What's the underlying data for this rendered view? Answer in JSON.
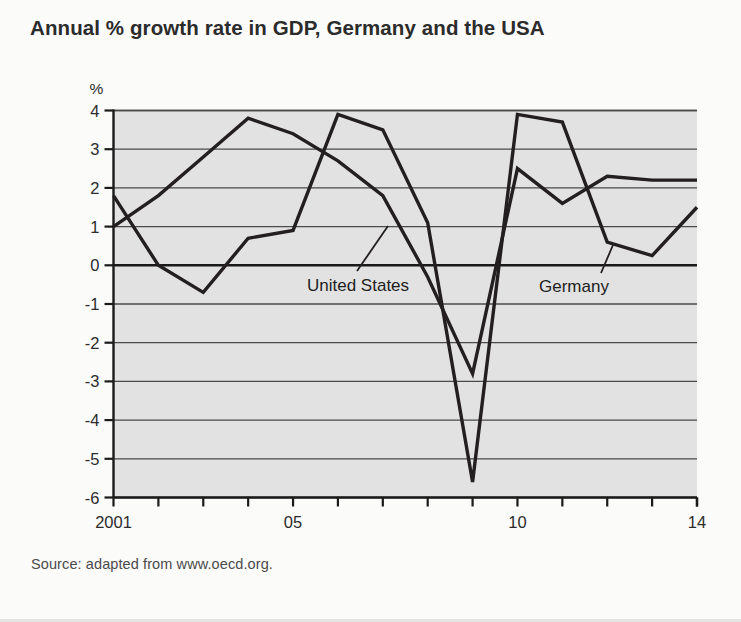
{
  "figure": {
    "title": "Annual % growth rate in GDP, Germany and the USA",
    "source": "Source: adapted from www.oecd.org.",
    "unit_label": "%",
    "plot_background": "#e2e2e2",
    "line_color": "#231f20",
    "grid_color": "#4a4a4a",
    "axis_color": "#1a1a1a"
  },
  "annotations": {
    "united_states": "United States",
    "germany": "Germany"
  },
  "chart_data": {
    "type": "line",
    "title": "Annual % growth rate in GDP, Germany and the USA",
    "subtitle": "",
    "xlabel": "",
    "ylabel": "%",
    "x": [
      2001,
      2002,
      2003,
      2004,
      2005,
      2006,
      2007,
      2008,
      2009,
      2010,
      2011,
      2012,
      2013,
      2014
    ],
    "xtick_values": [
      2001,
      2005,
      2010,
      2014
    ],
    "xtick_labels": [
      "2001",
      "05",
      "10",
      "14"
    ],
    "xlim": [
      2001,
      2014
    ],
    "ytick_values": [
      4,
      3,
      2,
      1,
      0,
      -1,
      -2,
      -3,
      -4,
      -5,
      -6
    ],
    "ytick_labels": [
      "4",
      "3",
      "2",
      "1",
      "0",
      "-1",
      "-2",
      "-3",
      "-4",
      "-5",
      "-6"
    ],
    "ylim": [
      -6,
      4
    ],
    "grid": true,
    "legend": "inline-annotations",
    "series": [
      {
        "name": "Germany",
        "values": [
          1.8,
          0.0,
          -0.7,
          0.7,
          0.9,
          3.9,
          3.5,
          1.1,
          -5.6,
          3.9,
          3.7,
          0.6,
          0.25,
          1.5
        ]
      },
      {
        "name": "United States",
        "values": [
          1.0,
          1.8,
          2.8,
          3.8,
          3.4,
          2.7,
          1.8,
          -0.3,
          -2.8,
          2.5,
          1.6,
          2.3,
          2.2,
          2.2
        ]
      }
    ]
  }
}
